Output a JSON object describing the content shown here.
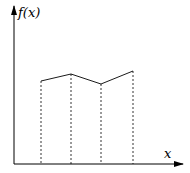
{
  "chart_data": {
    "type": "line",
    "title": "",
    "xlabel": "x",
    "ylabel": "f(x)",
    "x": [
      1,
      2,
      3,
      4
    ],
    "values": [
      2.6,
      2.9,
      2.5,
      3.0
    ],
    "grid": false,
    "legend": null,
    "annotations": [
      "dashed vertical lines from each point down to the x-axis (trapezoid rule illustration)"
    ]
  },
  "labels": {
    "y_axis": "f(x)",
    "x_axis": "x"
  },
  "geometry": {
    "origin": [
      14,
      164
    ],
    "points": [
      [
        41,
        81
      ],
      [
        71,
        74
      ],
      [
        101,
        84
      ],
      [
        133,
        71
      ]
    ]
  }
}
